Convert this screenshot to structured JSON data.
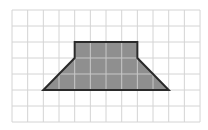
{
  "diagram": {
    "type": "grid-shape",
    "grid": {
      "columns": 12,
      "rows": 7,
      "origin_px": [
        12,
        10
      ],
      "cell_w_px": 15.67,
      "cell_h_px": 16,
      "line_color": "#d4d4d4"
    },
    "shape": {
      "name": "trapezoid-with-rectangular-top",
      "vertices_grid": [
        [
          4,
          2
        ],
        [
          8,
          2
        ],
        [
          8,
          3
        ],
        [
          10,
          5
        ],
        [
          2,
          5
        ],
        [
          4,
          3
        ]
      ],
      "fill": "#8f8f8f",
      "stroke": "#2a2a2a",
      "inner_grid_color": "#c8c8c8"
    }
  }
}
